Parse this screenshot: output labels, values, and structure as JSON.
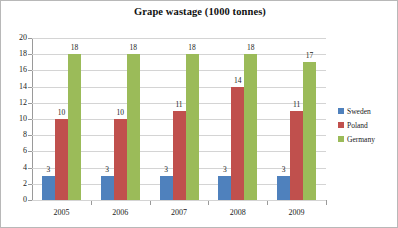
{
  "chart_data": {
    "type": "bar",
    "title": "Grape wastage (1000 tonnes)",
    "xlabel": "",
    "ylabel": "",
    "categories": [
      "2005",
      "2006",
      "2007",
      "2008",
      "2009"
    ],
    "series": [
      {
        "name": "Sweden",
        "color": "#4F81BD",
        "values": [
          3,
          3,
          3,
          3,
          3
        ]
      },
      {
        "name": "Poland",
        "color": "#C0504D",
        "values": [
          10,
          10,
          11,
          14,
          11
        ]
      },
      {
        "name": "Germany",
        "color": "#9BBB59",
        "values": [
          18,
          18,
          18,
          18,
          17
        ]
      }
    ],
    "ylim": [
      0,
      20
    ],
    "ytick_labels": [
      "20",
      "18",
      "16",
      "14",
      "12",
      "10",
      "8",
      "6",
      "4",
      "2",
      "0"
    ],
    "ytick_values": [
      20,
      18,
      16,
      14,
      12,
      10,
      8,
      6,
      4,
      2,
      0
    ],
    "grid": true,
    "data_labels": true,
    "legend_position": "right"
  }
}
